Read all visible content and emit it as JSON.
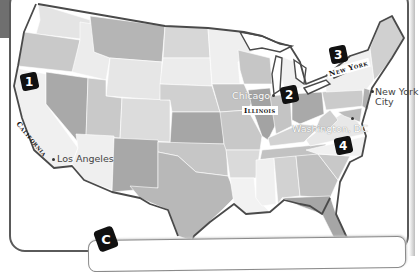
{
  "map": {
    "title": "United States",
    "colors": {
      "frame": "#5a5a5a",
      "coast": "#4a4a4a",
      "marker_bg": "#111111",
      "marker_fg": "#ffffff",
      "state_shades": [
        "#d9d9d9",
        "#c4c4c4",
        "#b3b3b3",
        "#a6a6a6",
        "#ebebeb",
        "#cfcfcf"
      ]
    },
    "markers": [
      {
        "number": "1",
        "location": "California"
      },
      {
        "number": "2",
        "location": "Chicago, Illinois"
      },
      {
        "number": "3",
        "location": "New York"
      },
      {
        "number": "4",
        "location": "Washington, DC"
      }
    ],
    "state_labels": {
      "california": "California",
      "illinois": "Illinois",
      "new_york": "New York"
    },
    "cities": {
      "los_angeles": "Los Angeles",
      "chicago": "Chicago",
      "new_york_city_line1": "New York",
      "new_york_city_line2": "City",
      "washington_dc": "Washington, DC"
    }
  },
  "section": {
    "badge": "C"
  }
}
